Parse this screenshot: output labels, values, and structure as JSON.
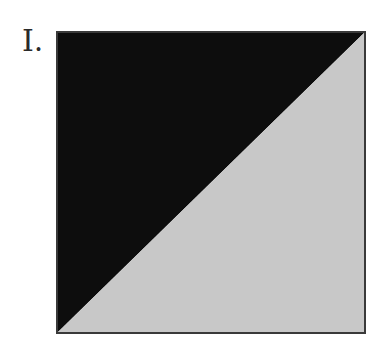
{
  "figure": {
    "label": "I.",
    "shape": "square-split-diagonal",
    "colors": {
      "upper_left_triangle": "#0d0d0d",
      "lower_right_triangle": "#c8c8c8",
      "border": "#3a3a3a"
    }
  }
}
